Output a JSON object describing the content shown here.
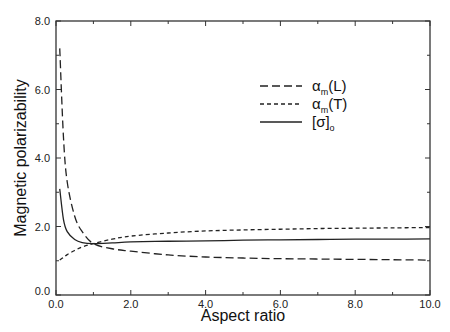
{
  "chart_data": {
    "type": "line",
    "title": "",
    "xlabel": "Aspect ratio",
    "ylabel": "Magnetic polarizability",
    "xlim": [
      0,
      10
    ],
    "ylim": [
      0,
      8
    ],
    "xticks": [
      "0.0",
      "2.0",
      "4.0",
      "6.0",
      "8.0",
      "10.0"
    ],
    "yticks": [
      "0.0",
      "2.0",
      "4.0",
      "6.0",
      "8.0"
    ],
    "grid": false,
    "legend_position": "upper right (inside)",
    "x": [
      0.1,
      0.2,
      0.3,
      0.5,
      0.7,
      1.0,
      1.5,
      2.0,
      3.0,
      4.0,
      5.0,
      6.0,
      7.0,
      8.0,
      9.0,
      10.0
    ],
    "series": [
      {
        "name": "α_m(L)",
        "label_main": "α",
        "label_sub": "m",
        "label_tail": "(L)",
        "style": "long-dash",
        "values": [
          7.2,
          4.6,
          3.3,
          2.3,
          1.85,
          1.5,
          1.35,
          1.28,
          1.17,
          1.11,
          1.08,
          1.06,
          1.05,
          1.04,
          1.03,
          1.02
        ]
      },
      {
        "name": "α_m(T)",
        "label_main": "α",
        "label_sub": "m",
        "label_tail": "(T)",
        "style": "short-dash",
        "values": [
          1.02,
          1.1,
          1.18,
          1.3,
          1.4,
          1.5,
          1.63,
          1.72,
          1.81,
          1.87,
          1.9,
          1.92,
          1.94,
          1.95,
          1.96,
          1.97
        ]
      },
      {
        "name": "[σ]_o",
        "label_main": "[σ]",
        "label_sub": "o",
        "label_tail": "",
        "style": "solid",
        "values": [
          3.1,
          2.2,
          1.85,
          1.62,
          1.53,
          1.5,
          1.52,
          1.55,
          1.57,
          1.58,
          1.6,
          1.61,
          1.62,
          1.63,
          1.63,
          1.64
        ]
      }
    ]
  }
}
